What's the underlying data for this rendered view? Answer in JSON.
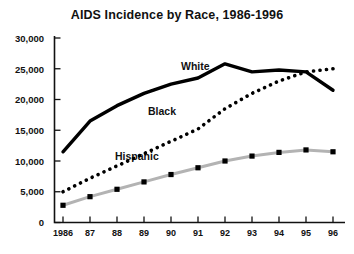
{
  "chart_data": {
    "type": "line",
    "title": "AIDS Incidence by Race, 1986-1996",
    "xlabel": "",
    "ylabel": "",
    "categories": [
      "1986",
      "87",
      "88",
      "89",
      "90",
      "91",
      "92",
      "93",
      "94",
      "95",
      "96"
    ],
    "x_tick_labels": [
      "1986",
      "87",
      "88",
      "89",
      "90",
      "91",
      "92",
      "93",
      "94",
      "95",
      "96"
    ],
    "y_tick_labels": [
      "0",
      "5,000",
      "10,000",
      "15,000",
      "20,000",
      "25,000",
      "30,000"
    ],
    "y_tick_values": [
      0,
      5000,
      10000,
      15000,
      20000,
      25000,
      30000
    ],
    "ylim": [
      0,
      30000
    ],
    "grid": false,
    "legend_position": "inline-labels",
    "series": [
      {
        "name": "White",
        "style": "solid-thick",
        "color": "#000000",
        "values": [
          11500,
          16500,
          19000,
          21000,
          22500,
          23500,
          25800,
          24500,
          24800,
          24500,
          21500
        ]
      },
      {
        "name": "Black",
        "style": "dotted",
        "color": "#000000",
        "values": [
          5000,
          7200,
          9200,
          11200,
          13200,
          15200,
          18500,
          21000,
          23000,
          24500,
          25000
        ]
      },
      {
        "name": "Hispanic",
        "style": "line-with-square-markers",
        "color": "#b0b0b0",
        "marker_color": "#000000",
        "values": [
          2800,
          4200,
          5400,
          6600,
          7800,
          8900,
          10000,
          10800,
          11400,
          11800,
          11500
        ]
      }
    ]
  },
  "axis": {
    "y_label_0": "0",
    "y_label_1": "5,000",
    "y_label_2": "10,000",
    "y_label_3": "15,000",
    "y_label_4": "20,000",
    "y_label_5": "25,000",
    "y_label_6": "30,000",
    "x_label_0": "1986",
    "x_label_1": "87",
    "x_label_2": "88",
    "x_label_3": "89",
    "x_label_4": "90",
    "x_label_5": "91",
    "x_label_6": "92",
    "x_label_7": "93",
    "x_label_8": "94",
    "x_label_9": "95",
    "x_label_10": "96"
  },
  "labels": {
    "white": "White",
    "black": "Black",
    "hispanic": "Hispanic"
  }
}
